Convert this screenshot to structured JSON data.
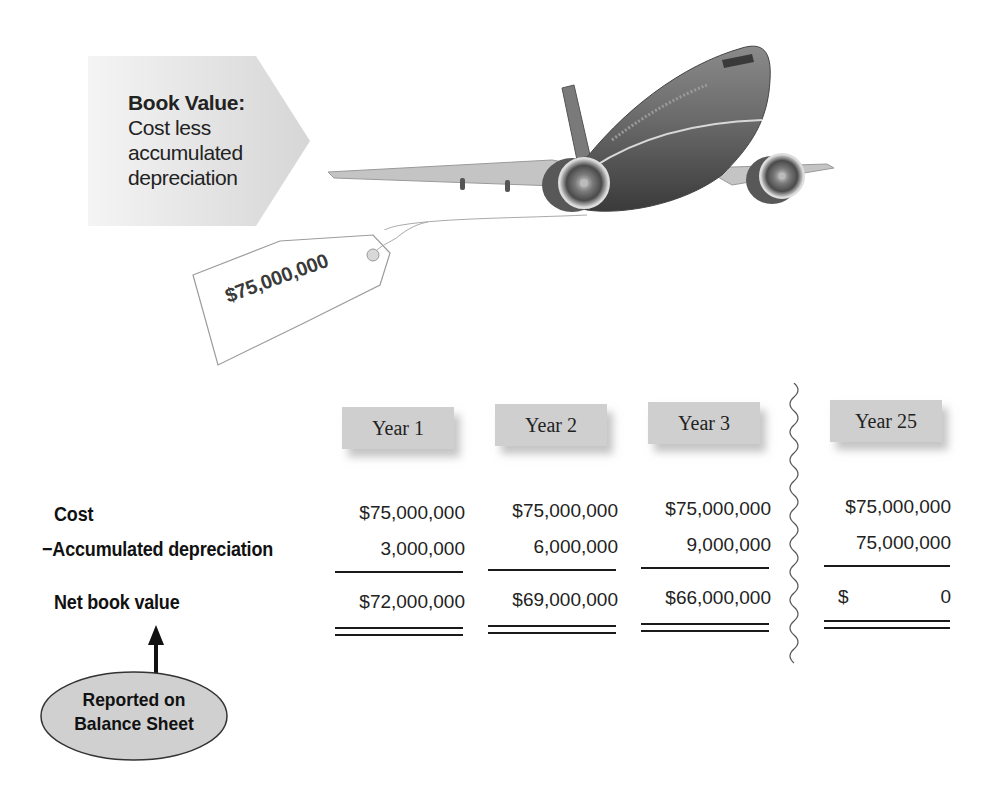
{
  "callout": {
    "title": "Book Value:",
    "lines": [
      "Cost less",
      "accumulated",
      "depreciation"
    ],
    "fill_color": "#e4e4e4"
  },
  "price_tag": {
    "amount": "$75,000,000"
  },
  "illustration": {
    "subject": "airplane-icon"
  },
  "table": {
    "columns": [
      "Year 1",
      "Year 2",
      "Year 3",
      "Year 25"
    ],
    "header_fill": "#cfcfcf",
    "rows": [
      {
        "label": "Cost",
        "prefix": "",
        "values": [
          "$75,000,000",
          "$75,000,000",
          "$75,000,000",
          "$75,000,000"
        ]
      },
      {
        "label": "Accumulated depreciation",
        "prefix": "−",
        "values": [
          "3,000,000",
          "6,000,000",
          "9,000,000",
          "75,000,000"
        ]
      },
      {
        "label": "Net book value",
        "prefix": "",
        "values": [
          "$72,000,000",
          "$69,000,000",
          "$66,000,000",
          "0"
        ],
        "year25_currency": "$"
      }
    ],
    "break_marker": "wavy-line"
  },
  "note": {
    "lines": [
      "Reported on",
      "Balance Sheet"
    ],
    "fill_color": "#d0d0d0"
  }
}
